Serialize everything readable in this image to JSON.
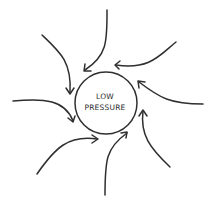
{
  "diagram": {
    "center_label_line1": "LOW",
    "center_label_line2": "PRESSURE",
    "stroke_color": "#2f2f2f",
    "arrow_count": 8
  }
}
